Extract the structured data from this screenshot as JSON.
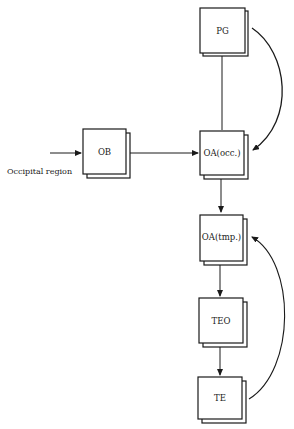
{
  "diagram": {
    "type": "flowchart",
    "colors": {
      "stroke": "#1a1a1a",
      "fill": "#ffffff",
      "background": "#ffffff"
    },
    "input": {
      "label": "Occipital region"
    },
    "nodes": [
      {
        "id": "PG",
        "label": "PG"
      },
      {
        "id": "OB",
        "label": "OB"
      },
      {
        "id": "OA_occ",
        "label": "OA(occ.)"
      },
      {
        "id": "OA_tmp",
        "label": "OA(tmp.)"
      },
      {
        "id": "TEO",
        "label": "TEO"
      },
      {
        "id": "TE",
        "label": "TE"
      }
    ],
    "edges": [
      {
        "from": "Occipital region",
        "to": "OB",
        "style": "straight-arrow"
      },
      {
        "from": "OB",
        "to": "OA(occ.)",
        "style": "straight-arrow"
      },
      {
        "from": "OA(occ.)",
        "to": "PG",
        "style": "straight-line"
      },
      {
        "from": "PG",
        "to": "OA(occ.)",
        "style": "curved-arrow"
      },
      {
        "from": "OA(occ.)",
        "to": "OA(tmp.)",
        "style": "straight-arrow"
      },
      {
        "from": "OA(tmp.)",
        "to": "TEO",
        "style": "straight-arrow"
      },
      {
        "from": "TEO",
        "to": "TE",
        "style": "straight-arrow"
      },
      {
        "from": "TE",
        "to": "OA(tmp.)",
        "style": "curved-arrow"
      }
    ]
  }
}
